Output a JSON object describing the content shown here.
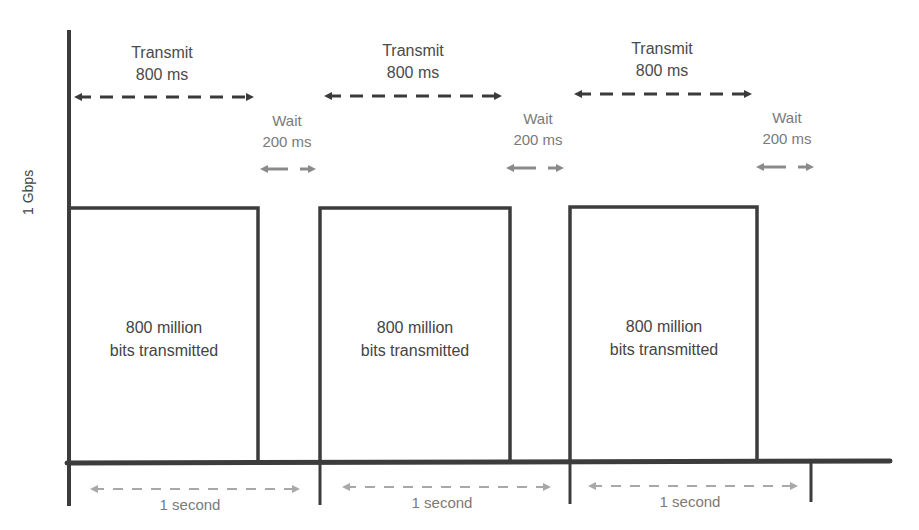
{
  "diagram": {
    "y_axis_label": "1 Gbps",
    "cycles": [
      {
        "transmit_label": "Transmit",
        "transmit_duration": "800 ms",
        "wait_label": "Wait",
        "wait_duration": "200 ms",
        "box_line1": "800 million",
        "box_line2": "bits transmitted",
        "period_label": "1 second"
      },
      {
        "transmit_label": "Transmit",
        "transmit_duration": "800 ms",
        "wait_label": "Wait",
        "wait_duration": "200 ms",
        "box_line1": "800 million",
        "box_line2": "bits transmitted",
        "period_label": "1 second"
      },
      {
        "transmit_label": "Transmit",
        "transmit_duration": "800 ms",
        "wait_label": "Wait",
        "wait_duration": "200 ms",
        "box_line1": "800 million",
        "box_line2": "bits transmitted",
        "period_label": "1 second"
      }
    ],
    "colors": {
      "axis": "#3c3c3c",
      "transmit_arrow": "#3a3a3a",
      "wait_arrow": "#8a8a8a",
      "period_arrow": "#a0a0a0",
      "background": "#ffffff"
    }
  }
}
